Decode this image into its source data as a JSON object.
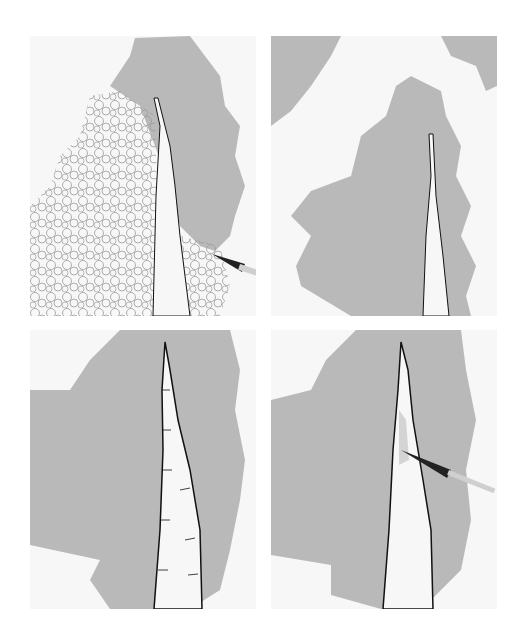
{
  "figure": {
    "layout": "2x2 grid",
    "panels": [
      {
        "step": 1,
        "label": "pencil-scribble-foliage-with-wash-on-right",
        "has_brush": true
      },
      {
        "step": 2,
        "label": "grey-foliage-wash-complete",
        "has_brush": false
      },
      {
        "step": 3,
        "label": "trunk-outlined-with-bark-marks",
        "has_brush": false
      },
      {
        "step": 4,
        "label": "adding-trunk-shading",
        "has_brush": true
      }
    ],
    "colors": {
      "background": "#ffffff",
      "paper": "#f7f7f7",
      "foliage": "#b9b9b9",
      "foliage_dark": "#a8a8a8",
      "scribble": "#9a9a9a",
      "ink": "#111111",
      "brush_handle": "#222222",
      "brush_ferrule": "#cfcfcf"
    }
  }
}
